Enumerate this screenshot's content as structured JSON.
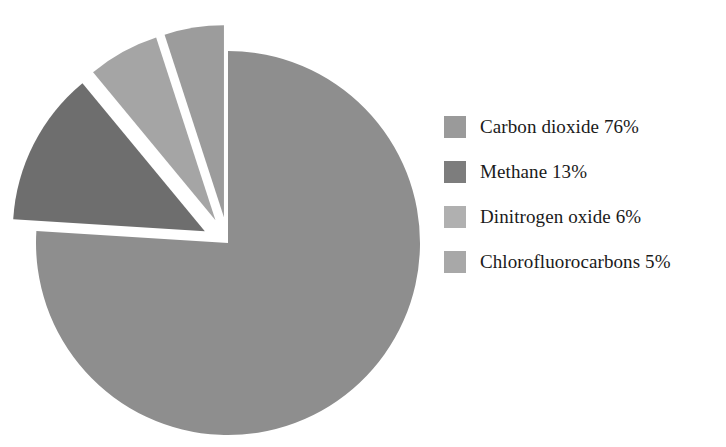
{
  "chart_data": {
    "type": "pie",
    "title": "",
    "subtitle": "",
    "xlabel": "",
    "ylabel": "",
    "legend_position": "right",
    "grid": false,
    "units": "percent",
    "start_angle_deg": 0,
    "direction": "clockwise",
    "categories": [
      "Carbon dioxide",
      "Methane",
      "Dinitrogen oxide",
      "Chlorofluorocarbons"
    ],
    "values": [
      76,
      13,
      6,
      5
    ],
    "slices": [
      {
        "label": "Carbon dioxide",
        "value": 76,
        "value_text": "76%",
        "legend_text": "Carbon dioxide 76%",
        "color": "#8e8e8e",
        "swatch_color": "#9a9a9a",
        "exploded": false,
        "start_angle_deg": 0,
        "end_angle_deg": 273.6
      },
      {
        "label": "Methane",
        "value": 13,
        "value_text": "13%",
        "legend_text": "Methane 13%",
        "color": "#6e6e6e",
        "swatch_color": "#7d7d7d",
        "exploded": true,
        "start_angle_deg": 273.6,
        "end_angle_deg": 320.4
      },
      {
        "label": "Dinitrogen oxide",
        "value": 6,
        "value_text": "6%",
        "legend_text": "Dinitrogen oxide 6%",
        "color": "#a5a5a5",
        "swatch_color": "#b0b0b0",
        "exploded": true,
        "start_angle_deg": 320.4,
        "end_angle_deg": 342.0
      },
      {
        "label": "Chlorofluorocarbons",
        "value": 5,
        "value_text": "5%",
        "legend_text": "Chlorofluorocarbons 5%",
        "color": "#9c9c9c",
        "swatch_color": "#a8a8a8",
        "exploded": true,
        "start_angle_deg": 342.0,
        "end_angle_deg": 360.0
      }
    ]
  },
  "legend": {
    "items": [
      {
        "label": "Carbon dioxide 76%",
        "color": "#9a9a9a"
      },
      {
        "label": "Methane 13%",
        "color": "#7d7d7d"
      },
      {
        "label": "Dinitrogen oxide 6%",
        "color": "#b0b0b0"
      },
      {
        "label": "Chlorofluorocarbons 5%",
        "color": "#a8a8a8"
      }
    ]
  }
}
